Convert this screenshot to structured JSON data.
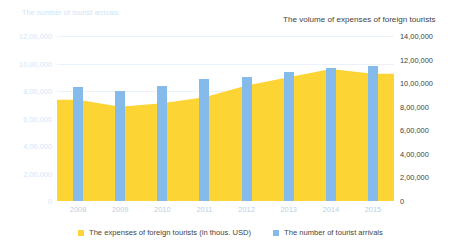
{
  "axis_titles": {
    "left": "The number of tourist arrivals",
    "right": "The volume of expenses of foreign tourists"
  },
  "colors": {
    "bars": "#84bbea",
    "area": "#fcd434",
    "gridline": "#eaf2fb",
    "left_axis_text": "#d3e6f8",
    "right_axis_text": "#3f3f3f",
    "x_axis_text": "#b9cfe4",
    "background": "#ffffff"
  },
  "legend": {
    "position": "bottom",
    "items": [
      {
        "label": "The expenses of foreign tourists (in thous. USD)",
        "color": "#fcd434",
        "icon": "square-swatch-icon"
      },
      {
        "label": "The number of tourist arrivals",
        "color": "#84bbea",
        "icon": "square-swatch-icon"
      }
    ]
  },
  "chart_data": {
    "type": "bar",
    "title": "",
    "subtitle": "",
    "xlabel": "",
    "ylabel": "The number of tourist arrivals",
    "y2label": "The volume of expenses of foreign tourists",
    "grid": true,
    "categories": [
      "2008",
      "2009",
      "2010",
      "2011",
      "2012",
      "2013",
      "2014",
      "2015"
    ],
    "x_tick_labels": [
      "2008",
      "2009",
      "2010",
      "2011",
      "2012",
      "2013",
      "2014",
      "2015"
    ],
    "left_axis": {
      "label": "The number of tourist arrivals",
      "ylim": [
        0,
        1200000
      ],
      "ticks": [
        0,
        200000,
        400000,
        600000,
        800000,
        1000000,
        1200000
      ],
      "tick_labels": [
        "0",
        "2,00,000",
        "4,00,000",
        "6,00,000",
        "8,00,000",
        "10,00,000",
        "12,00,000"
      ]
    },
    "right_axis": {
      "label": "The volume of expenses of foreign tourists",
      "ylim": [
        0,
        1400000
      ],
      "ticks": [
        0,
        200000,
        400000,
        600000,
        800000,
        1000000,
        1200000,
        1400000
      ],
      "tick_labels": [
        "0",
        "2,00,000",
        "4,00,000",
        "6,00,000",
        "8,00,000",
        "10,00,000",
        "12,00,000",
        "14,00,000"
      ]
    },
    "series": [
      {
        "name": "The number of tourist arrivals",
        "type": "bar",
        "axis": "left",
        "color": "#84bbea",
        "values": [
          830000,
          800000,
          835000,
          885000,
          905000,
          940000,
          965000,
          980000
        ]
      },
      {
        "name": "The expenses of foreign tourists (in thous. USD)",
        "type": "area",
        "axis": "right",
        "color": "#fcd434",
        "values": [
          860000,
          800000,
          830000,
          880000,
          980000,
          1050000,
          1120000,
          1080000
        ]
      }
    ]
  }
}
